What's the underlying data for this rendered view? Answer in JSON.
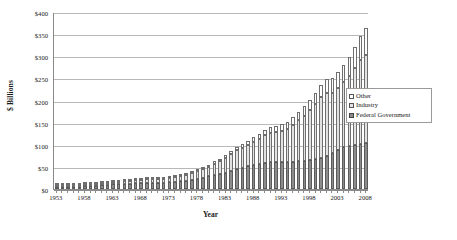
{
  "chart_data": {
    "type": "bar",
    "subtype": "stacked-column",
    "title": "",
    "xlabel": "Year",
    "ylabel": "$ Billions",
    "ylim": [
      0,
      400
    ],
    "ytick_step": 50,
    "grid": true,
    "legend_position": "right-inside",
    "ytick_labels": [
      "$0",
      "$50",
      "$100",
      "$150",
      "$200",
      "$250",
      "$300",
      "$350",
      "$400"
    ],
    "ytick_values": [
      0,
      50,
      100,
      150,
      200,
      250,
      300,
      350,
      400
    ],
    "xtick_labels": [
      "1953",
      "1958",
      "1963",
      "1968",
      "1973",
      "1978",
      "1983",
      "1988",
      "1993",
      "1998",
      "2003",
      "2008"
    ],
    "xtick_values": [
      1953,
      1958,
      1963,
      1968,
      1973,
      1978,
      1983,
      1988,
      1993,
      1998,
      2003,
      2008
    ],
    "categories": [
      1953,
      1954,
      1955,
      1956,
      1957,
      1958,
      1959,
      1960,
      1961,
      1962,
      1963,
      1964,
      1965,
      1966,
      1967,
      1968,
      1969,
      1970,
      1971,
      1972,
      1973,
      1974,
      1975,
      1976,
      1977,
      1978,
      1979,
      1980,
      1981,
      1982,
      1983,
      1984,
      1985,
      1986,
      1987,
      1988,
      1989,
      1990,
      1991,
      1992,
      1993,
      1994,
      1995,
      1996,
      1997,
      1998,
      1999,
      2000,
      2001,
      2002,
      2003,
      2004,
      2005,
      2006,
      2007,
      2008
    ],
    "colors": {
      "federal_government": "#8c8c8c",
      "industry": "#e2e2e2",
      "other": "#ffffff",
      "gridline": "#b8b8b8",
      "axis": "#8a8a8a"
    },
    "series": [
      {
        "name": "Federal Government",
        "values": [
          3.0,
          3.4,
          3.7,
          4.6,
          5.4,
          6.0,
          6.7,
          7.7,
          8.5,
          9.3,
          10.3,
          11.1,
          11.5,
          12.2,
          12.8,
          13.4,
          13.6,
          13.7,
          13.9,
          14.5,
          15.2,
          16.1,
          17.4,
          19.0,
          21.0,
          23.5,
          26.0,
          28.5,
          31.5,
          34.0,
          37.0,
          40.5,
          46.0,
          48.5,
          52.0,
          55.0,
          57.0,
          59.0,
          60.5,
          61.5,
          62.0,
          61.0,
          62.0,
          63.0,
          64.0,
          66.0,
          68.0,
          70.0,
          75.0,
          82.0,
          89.0,
          95.0,
          98.0,
          99.5,
          101.0,
          103.0
        ]
      },
      {
        "name": "Industry",
        "values": [
          2.2,
          2.5,
          2.7,
          3.3,
          3.6,
          3.8,
          4.1,
          4.4,
          4.7,
          5.0,
          5.3,
          5.7,
          6.2,
          6.9,
          7.4,
          8.0,
          8.4,
          8.5,
          8.5,
          9.0,
          10.0,
          11.0,
          11.8,
          13.0,
          14.5,
          16.3,
          19.0,
          22.0,
          26.0,
          29.0,
          32.5,
          38.0,
          42.0,
          45.0,
          48.0,
          52.0,
          57.0,
          62.0,
          66.0,
          68.0,
          70.0,
          74.0,
          83.0,
          93.0,
          102.0,
          112.0,
          124.0,
          138.0,
          143.0,
          136.0,
          140.0,
          146.0,
          158.0,
          174.0,
          190.0,
          201.0
        ]
      },
      {
        "name": "Other",
        "values": [
          0.3,
          0.3,
          0.4,
          0.4,
          0.5,
          0.5,
          0.6,
          0.7,
          0.8,
          0.9,
          1.0,
          1.1,
          1.2,
          1.4,
          1.5,
          1.7,
          1.8,
          2.0,
          2.1,
          2.2,
          2.4,
          2.6,
          2.9,
          3.2,
          3.5,
          3.9,
          4.3,
          4.8,
          5.3,
          5.8,
          6.3,
          7.0,
          7.7,
          8.4,
          9.2,
          10.0,
          11.0,
          12.0,
          13.0,
          14.0,
          15.0,
          16.0,
          17.5,
          19.0,
          21.0,
          23.0,
          25.0,
          27.0,
          30.0,
          33.0,
          36.0,
          39.0,
          43.0,
          48.0,
          54.0,
          60.0
        ]
      }
    ]
  },
  "legend": {
    "items": [
      {
        "label": "Other",
        "key": "other"
      },
      {
        "label": "Industry",
        "key": "industry"
      },
      {
        "label": "Federal Government",
        "key": "federal"
      }
    ]
  },
  "axes": {
    "x_title": "Year",
    "y_title": "$ Billions"
  }
}
